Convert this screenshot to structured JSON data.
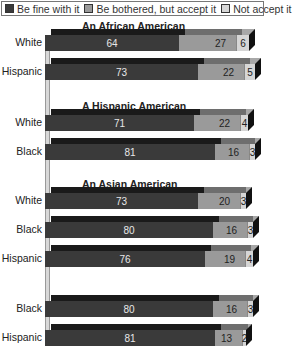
{
  "legend": {
    "items": [
      {
        "label": "Be fine with it",
        "color": "#3a3a3a"
      },
      {
        "label": "Be bothered, but accept it",
        "color": "#9a9a9a"
      },
      {
        "label": "Not accept it",
        "color": "#d6d6d6"
      }
    ]
  },
  "groups": [
    {
      "title": "An African American"
    },
    {
      "title": "A Hispanic American"
    },
    {
      "title": "An Asian American"
    },
    {
      "title": "A White American"
    }
  ],
  "rows": [
    {
      "label": "White",
      "fine": "64",
      "bothered": "27",
      "notaccept": "6"
    },
    {
      "label": "Hispanic",
      "fine": "73",
      "bothered": "22",
      "notaccept": "5"
    },
    {
      "label": "White",
      "fine": "71",
      "bothered": "22",
      "notaccept": "4"
    },
    {
      "label": "Black",
      "fine": "81",
      "bothered": "16",
      "notaccept": "3"
    },
    {
      "label": "White",
      "fine": "73",
      "bothered": "20",
      "notaccept": "3"
    },
    {
      "label": "Black",
      "fine": "80",
      "bothered": "16",
      "notaccept": "3"
    },
    {
      "label": "Hispanic",
      "fine": "76",
      "bothered": "19",
      "notaccept": "4"
    },
    {
      "label": "Black",
      "fine": "80",
      "bothered": "16",
      "notaccept": "3"
    },
    {
      "label": "Hispanic",
      "fine": "81",
      "bothered": "13",
      "notaccept": "2"
    }
  ],
  "chart_data": {
    "type": "bar",
    "orientation": "horizontal",
    "stacked": true,
    "title": "",
    "legend_position": "top",
    "grid": false,
    "series_names": [
      "Be fine with it",
      "Be bothered, but accept it",
      "Not accept it"
    ],
    "groups": [
      {
        "title": "An African American",
        "categories": [
          "White",
          "Hispanic"
        ],
        "series": [
          {
            "name": "Be fine with it",
            "values": [
              64,
              73
            ]
          },
          {
            "name": "Be bothered, but accept it",
            "values": [
              27,
              22
            ]
          },
          {
            "name": "Not accept it",
            "values": [
              6,
              5
            ]
          }
        ]
      },
      {
        "title": "A Hispanic American",
        "categories": [
          "White",
          "Black"
        ],
        "series": [
          {
            "name": "Be fine with it",
            "values": [
              71,
              81
            ]
          },
          {
            "name": "Be bothered, but accept it",
            "values": [
              22,
              16
            ]
          },
          {
            "name": "Not accept it",
            "values": [
              4,
              3
            ]
          }
        ]
      },
      {
        "title": "An Asian American",
        "categories": [
          "White",
          "Black",
          "Hispanic"
        ],
        "series": [
          {
            "name": "Be fine with it",
            "values": [
              73,
              80,
              76
            ]
          },
          {
            "name": "Be bothered, but accept it",
            "values": [
              20,
              16,
              19
            ]
          },
          {
            "name": "Not accept it",
            "values": [
              3,
              3,
              4
            ]
          }
        ]
      },
      {
        "title": "A White American",
        "categories": [
          "Black",
          "Hispanic"
        ],
        "series": [
          {
            "name": "Be fine with it",
            "values": [
              80,
              81
            ]
          },
          {
            "name": "Be bothered, but accept it",
            "values": [
              16,
              13
            ]
          },
          {
            "name": "Not accept it",
            "values": [
              3,
              2
            ]
          }
        ]
      }
    ],
    "xlim": [
      0,
      100
    ]
  }
}
